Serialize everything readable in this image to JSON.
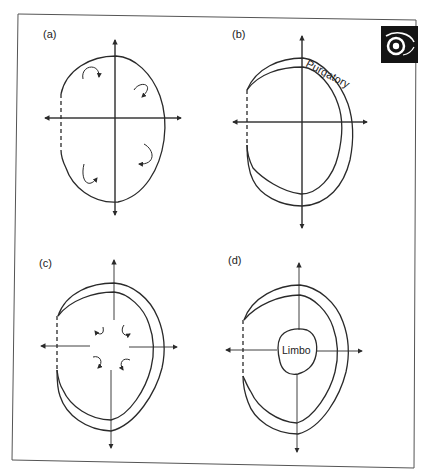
{
  "figure": {
    "panels": [
      {
        "id": "a",
        "label": "(a)"
      },
      {
        "id": "b",
        "label": "(b)",
        "region_label": "Purgatory"
      },
      {
        "id": "c",
        "label": "(c)"
      },
      {
        "id": "d",
        "label": "(d)",
        "region_label": "Limbo"
      }
    ],
    "logo": {
      "icon": "eye-icon"
    },
    "colors": {
      "stroke": "#2a2a2a",
      "background": "#ffffff",
      "logo_bg": "#141414"
    }
  }
}
